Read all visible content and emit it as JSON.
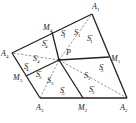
{
  "figure": {
    "colors": {
      "stroke": "#222222",
      "dashed": "#555555",
      "background": "#ffffff"
    },
    "vertices": {
      "A1": {
        "label": "A",
        "sub": "1",
        "x": 92,
        "y": 14,
        "lx": 92,
        "ly": 9
      },
      "A2": {
        "label": "A",
        "sub": "2",
        "x": 127,
        "y": 98,
        "lx": 120,
        "ly": 110
      },
      "A3": {
        "label": "A",
        "sub": "3",
        "x": 40,
        "y": 98,
        "lx": 36,
        "ly": 110
      },
      "A4": {
        "label": "A",
        "sub": "4",
        "x": 12,
        "y": 53,
        "lx": 1,
        "ly": 56
      }
    },
    "midpoints": {
      "M1": {
        "label": "M",
        "sub": "1",
        "x": 109,
        "y": 57,
        "lx": 111,
        "ly": 61
      },
      "M2": {
        "label": "M",
        "sub": "2",
        "x": 83,
        "y": 98,
        "lx": 78,
        "ly": 110
      },
      "M3": {
        "label": "M",
        "sub": "3",
        "x": 26,
        "y": 76,
        "lx": 13,
        "ly": 80
      },
      "M4": {
        "label": "M",
        "sub": "4",
        "x": 52,
        "y": 32,
        "lx": 43,
        "ly": 30
      }
    },
    "point_P": {
      "label": "P",
      "x": 59,
      "y": 60,
      "lx": 66,
      "ly": 55
    },
    "region_labels": [
      {
        "name": "S1'",
        "base": "S",
        "sub": "1",
        "prime": "′",
        "x": 61,
        "y": 36
      },
      {
        "name": "S1",
        "base": "S",
        "sub": "1",
        "prime": "",
        "x": 74,
        "y": 35
      },
      {
        "name": "S1''",
        "base": "S",
        "sub": "1",
        "prime": "″",
        "x": 87,
        "y": 41
      },
      {
        "name": "S2'",
        "base": "S",
        "sub": "2",
        "prime": "′",
        "x": 99,
        "y": 70
      },
      {
        "name": "S2",
        "base": "S",
        "sub": "2",
        "prime": "",
        "x": 84,
        "y": 78
      },
      {
        "name": "S2''",
        "base": "S",
        "sub": "2",
        "prime": "″",
        "x": 89,
        "y": 92
      },
      {
        "name": "S3'",
        "base": "S",
        "sub": "3",
        "prime": "′",
        "x": 60,
        "y": 93
      },
      {
        "name": "S3",
        "base": "S",
        "sub": "3",
        "prime": "",
        "x": 47,
        "y": 83
      },
      {
        "name": "S3''",
        "base": "S",
        "sub": "3",
        "prime": "″",
        "x": 36,
        "y": 77
      },
      {
        "name": "S4'",
        "base": "S",
        "sub": "4",
        "prime": "′",
        "x": 24,
        "y": 69
      },
      {
        "name": "S4",
        "base": "S",
        "sub": "4",
        "prime": "",
        "x": 33,
        "y": 61
      },
      {
        "name": "S4''",
        "base": "S",
        "sub": "4",
        "prime": "″",
        "x": 42,
        "y": 46
      }
    ]
  }
}
